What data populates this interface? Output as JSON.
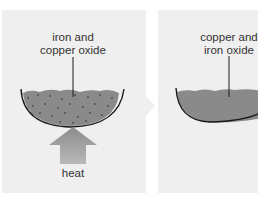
{
  "diagram": {
    "panels": [
      {
        "id": "before",
        "label_line1": "iron and",
        "label_line2": "copper oxide",
        "heat_label": "heat"
      },
      {
        "id": "after",
        "label_line1": "copper and",
        "label_line2": "iron oxide"
      }
    ],
    "colors": {
      "panel_bg": "#efefef",
      "mixture": "#8a8a8a",
      "dish_outline": "#1a1a1a",
      "arrow": "#999999",
      "text": "#333333"
    }
  }
}
